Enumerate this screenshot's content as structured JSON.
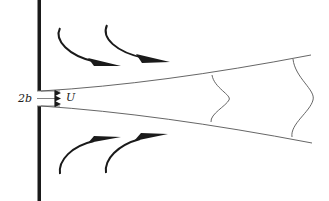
{
  "diagram": {
    "type": "plane jet issuing from a slot in a wall",
    "labels": {
      "slot_width": "2b",
      "exit_velocity": "U"
    },
    "colors": {
      "ink": "#1a1a1a",
      "thin_line": "#555555",
      "background": "#ffffff"
    },
    "elements": {
      "wall": "vertical wall with slot opening",
      "jet_boundaries": "two diverging spreading lines",
      "velocity_profiles": 2,
      "entrainment_arrows": 4
    }
  }
}
